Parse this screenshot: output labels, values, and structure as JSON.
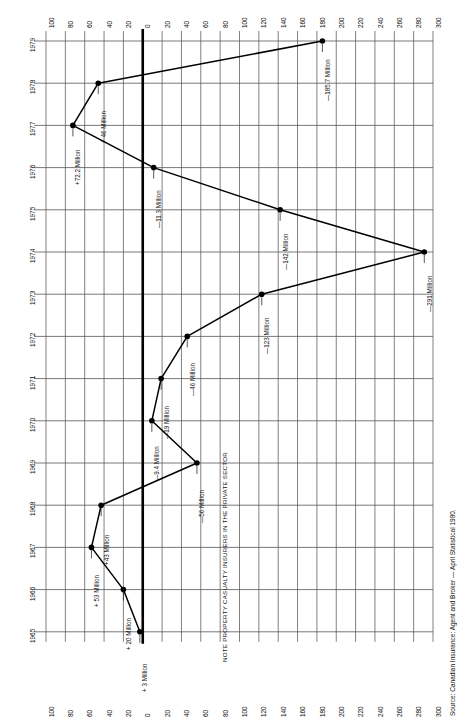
{
  "chart_data": {
    "type": "line",
    "title": "",
    "subtitle": "",
    "orientation": "horizontal-rotated",
    "xlabel": "",
    "ylabel": "",
    "grid": true,
    "legend_position": "none",
    "categories": [
      "1979",
      "1978",
      "1977",
      "1976",
      "1975",
      "1974",
      "1973",
      "1972",
      "1971",
      "1970",
      "1969",
      "1968",
      "1967",
      "1966",
      "1965"
    ],
    "values": [
      -185.7,
      46,
      72.2,
      -11.3,
      -142,
      -291,
      -123,
      -46,
      -19,
      -9.4,
      -56,
      43,
      53,
      20,
      3
    ],
    "point_labels": [
      "—185.7 Million",
      "+ 46 Million",
      "+72.2 Million",
      "—11.3 Million",
      "—142 Million",
      "—291 Million",
      "—123 Million",
      "—46 Million",
      "—19 Million",
      "—9.4 Million",
      "—56 Million",
      "+43 Million",
      "+ 53 Million",
      "+ 20 Million",
      "+ 3 Million"
    ],
    "value_axis_ticks": [
      "100",
      "80",
      "60",
      "40",
      "20",
      "0",
      "20",
      "40",
      "60",
      "80",
      "100",
      "120",
      "140",
      "160",
      "180",
      "200",
      "220",
      "240",
      "260",
      "280",
      "300"
    ],
    "value_axis_signed": [
      100,
      80,
      60,
      40,
      20,
      0,
      -20,
      -40,
      -60,
      -80,
      -100,
      -120,
      -140,
      -160,
      -180,
      -200,
      -220,
      -240,
      -260,
      -280,
      -300
    ],
    "value_axis_range": [
      100,
      -300
    ],
    "category_axis_ticks": [
      "1979",
      "1978",
      "1977",
      "1976",
      "1975",
      "1974",
      "1973",
      "1972",
      "1971",
      "1970",
      "1969",
      "1968",
      "1967",
      "1966",
      "1965"
    ],
    "axis_top_label_first": "100",
    "axis_top_label_last": "300",
    "axis_bottom_label_first": "100",
    "axis_bottom_label_last": "300",
    "annotations": [
      "NOTE PROPERTY CASUALTY INSURERS IN THE PRIVATE SECTOR"
    ],
    "source": "Source: Canadian Insurance: Agent and Broker — April Statistical 1980.",
    "colors": {
      "line": "#000000",
      "marker": "#000000",
      "grid": "#555555",
      "zero_axis": "#000000",
      "background": "#ffffff"
    }
  },
  "note": {
    "text": "NOTE PROPERTY CASUALTY INSURERS IN THE PRIVATE SECTOR"
  },
  "source": {
    "text": "Source: Canadian Insurance: Agent and Broker — April Statistical 1980."
  }
}
